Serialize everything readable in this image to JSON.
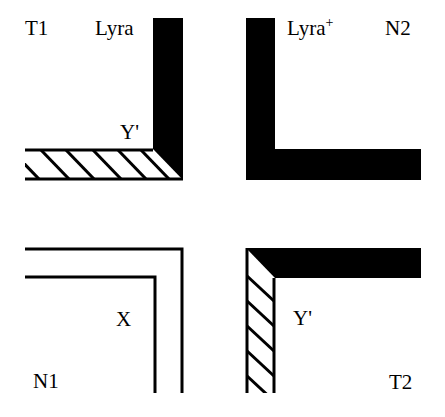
{
  "quadrants": {
    "top_left": {
      "corner_label": "T1",
      "strand_label": "Lyra",
      "junction_label": "Y'",
      "vertical_strand": "solid",
      "horizontal_strand": "hatched"
    },
    "top_right": {
      "corner_label": "N2",
      "strand_label": "Lyra",
      "strand_label_superscript": "+",
      "vertical_strand": "solid",
      "horizontal_strand": "solid"
    },
    "bottom_left": {
      "corner_label": "N1",
      "junction_label": "X",
      "strands": "outline"
    },
    "bottom_right": {
      "corner_label": "T2",
      "junction_label": "Y'",
      "vertical_strand": "hatched",
      "horizontal_strand": "solid"
    }
  },
  "colors": {
    "stroke": "#000000",
    "background": "#ffffff"
  }
}
